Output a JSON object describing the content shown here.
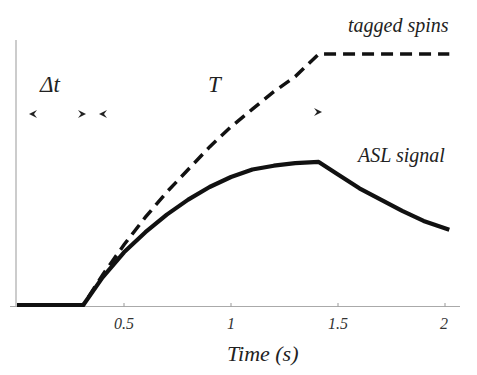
{
  "chart_data": {
    "type": "line",
    "title": "",
    "xlabel": "Time (s)",
    "ylabel": "",
    "xlim": [
      0,
      2.05
    ],
    "ylim": [
      0,
      1
    ],
    "xticks": [
      0.5,
      1,
      1.5,
      2
    ],
    "xtick_labels": [
      "0.5",
      "1",
      "1.5",
      "2"
    ],
    "grid": false,
    "legend": "inline annotations",
    "series": [
      {
        "name": "tagged spins",
        "style": "dashed",
        "x": [
          0.0,
          0.31,
          0.4,
          0.5,
          0.6,
          0.7,
          0.8,
          0.9,
          1.0,
          1.1,
          1.2,
          1.3,
          1.41,
          1.6,
          1.8,
          2.02
        ],
        "y": [
          0.0,
          0.0,
          0.12,
          0.24,
          0.35,
          0.45,
          0.54,
          0.63,
          0.71,
          0.78,
          0.85,
          0.91,
          1.0,
          1.0,
          1.0,
          1.0
        ]
      },
      {
        "name": "ASL signal",
        "style": "solid",
        "x": [
          0.0,
          0.31,
          0.4,
          0.5,
          0.6,
          0.7,
          0.8,
          0.9,
          1.0,
          1.1,
          1.2,
          1.3,
          1.41,
          1.5,
          1.6,
          1.7,
          1.8,
          1.9,
          2.02
        ],
        "y": [
          0.0,
          0.0,
          0.11,
          0.21,
          0.29,
          0.36,
          0.42,
          0.47,
          0.51,
          0.54,
          0.555,
          0.565,
          0.57,
          0.52,
          0.465,
          0.42,
          0.375,
          0.335,
          0.3
        ]
      }
    ],
    "annotations": [
      {
        "text": "Δt",
        "type": "interval",
        "from": 0.0,
        "to": 0.31
      },
      {
        "text": "T",
        "type": "interval",
        "from": 0.4,
        "to": 1.41
      },
      {
        "text": "tagged spins",
        "type": "series-label"
      },
      {
        "text": "ASL signal",
        "type": "series-label"
      }
    ]
  },
  "labels": {
    "tagged": "tagged spins",
    "asl": "ASL signal",
    "delta_t": "Δt",
    "T": "T",
    "xlabel": "Time (s)",
    "ticks": [
      "0.5",
      "1",
      "1.5",
      "2"
    ]
  }
}
